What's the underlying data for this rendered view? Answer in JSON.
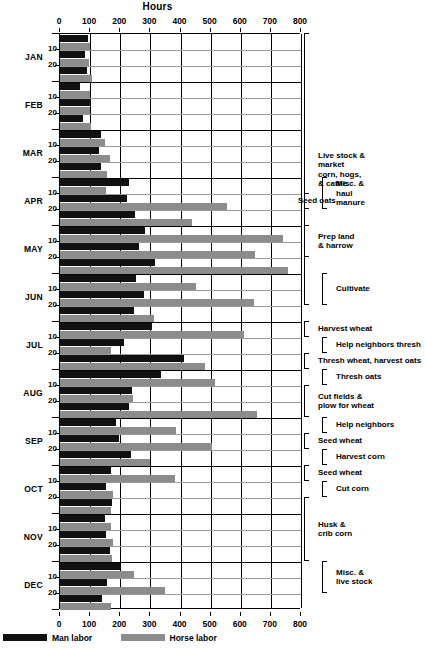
{
  "chart_data": {
    "type": "bar",
    "orientation": "horizontal",
    "title": "Hours",
    "xlabel": "Hours",
    "ylabel": "",
    "xlim": [
      0,
      800
    ],
    "xticks": [
      0,
      100,
      200,
      300,
      400,
      500,
      600,
      700,
      800
    ],
    "grid": true,
    "legend_position": "bottom-left",
    "legend": [
      "Man labor",
      "Horse labor"
    ],
    "series": [
      {
        "name": "Man labor",
        "color": "#111111"
      },
      {
        "name": "Horse labor",
        "color": "#8c8c8c"
      }
    ],
    "months": [
      "JAN",
      "FEB",
      "MAR",
      "APR",
      "MAY",
      "JUN",
      "JUL",
      "AUG",
      "SEP",
      "OCT",
      "NOV",
      "DEC"
    ],
    "period_ticks": [
      "10",
      "20"
    ],
    "rows": [
      {
        "month": "JAN",
        "period": "1",
        "man": 92,
        "horse": 98
      },
      {
        "month": "JAN",
        "period": "10",
        "man": 83,
        "horse": 96
      },
      {
        "month": "JAN",
        "period": "20",
        "man": 88,
        "horse": 105
      },
      {
        "month": "FEB",
        "period": "1",
        "man": 68,
        "horse": 98
      },
      {
        "month": "FEB",
        "period": "10",
        "man": 104,
        "horse": 101
      },
      {
        "month": "FEB",
        "period": "20",
        "man": 78,
        "horse": 102
      },
      {
        "month": "MAR",
        "period": "1",
        "man": 136,
        "horse": 148
      },
      {
        "month": "MAR",
        "period": "10",
        "man": 128,
        "horse": 167
      },
      {
        "month": "MAR",
        "period": "20",
        "man": 135,
        "horse": 157
      },
      {
        "month": "APR",
        "period": "1",
        "man": 229,
        "horse": 152
      },
      {
        "month": "APR",
        "period": "10",
        "man": 222,
        "horse": 555
      },
      {
        "month": "APR",
        "period": "20",
        "man": 250,
        "horse": 438
      },
      {
        "month": "MAY",
        "period": "1",
        "man": 283,
        "horse": 740
      },
      {
        "month": "MAY",
        "period": "10",
        "man": 261,
        "horse": 648
      },
      {
        "month": "MAY",
        "period": "20",
        "man": 315,
        "horse": 758
      },
      {
        "month": "JUN",
        "period": "1",
        "man": 251,
        "horse": 450
      },
      {
        "month": "JUN",
        "period": "10",
        "man": 278,
        "horse": 644
      },
      {
        "month": "JUN",
        "period": "20",
        "man": 246,
        "horse": 312
      },
      {
        "month": "JUL",
        "period": "1",
        "man": 305,
        "horse": 610
      },
      {
        "month": "JUL",
        "period": "10",
        "man": 214,
        "horse": 168
      },
      {
        "month": "JUL",
        "period": "20",
        "man": 412,
        "horse": 480
      },
      {
        "month": "AUG",
        "period": "1",
        "man": 336,
        "horse": 515
      },
      {
        "month": "AUG",
        "period": "10",
        "man": 238,
        "horse": 243
      },
      {
        "month": "AUG",
        "period": "20",
        "man": 228,
        "horse": 655
      },
      {
        "month": "SEP",
        "period": "1",
        "man": 186,
        "horse": 384
      },
      {
        "month": "SEP",
        "period": "10",
        "man": 196,
        "horse": 503
      },
      {
        "month": "SEP",
        "period": "20",
        "man": 235,
        "horse": 300
      },
      {
        "month": "OCT",
        "period": "1",
        "man": 168,
        "horse": 383
      },
      {
        "month": "OCT",
        "period": "10",
        "man": 152,
        "horse": 176
      },
      {
        "month": "OCT",
        "period": "20",
        "man": 172,
        "horse": 170
      },
      {
        "month": "NOV",
        "period": "1",
        "man": 148,
        "horse": 170
      },
      {
        "month": "NOV",
        "period": "10",
        "man": 152,
        "horse": 177
      },
      {
        "month": "NOV",
        "period": "20",
        "man": 167,
        "horse": 174
      },
      {
        "month": "DEC",
        "period": "1",
        "man": 198,
        "horse": 247
      },
      {
        "month": "DEC",
        "period": "10",
        "man": 155,
        "horse": 350
      },
      {
        "month": "DEC",
        "period": "20",
        "man": 140,
        "horse": 168
      }
    ],
    "annotations": [
      {
        "label": "Live stock &\nmarket\ncorn, hogs,\n& cattle",
        "from_row": 0,
        "to_row": 17
      },
      {
        "label": "Misc. &\nhaul\nmanure",
        "from_row": 9,
        "to_row": 11
      },
      {
        "label": "Seed oats",
        "from_row": 10,
        "to_row": 11
      },
      {
        "label": "Prep land\n& harrow",
        "from_row": 12,
        "to_row": 14
      },
      {
        "label": "Cultivate",
        "from_row": 15,
        "to_row": 17
      },
      {
        "label": "Harvest wheat",
        "from_row": 18,
        "to_row": 19
      },
      {
        "label": "Help neighbors thresh",
        "from_row": 19,
        "to_row": 20
      },
      {
        "label": "Thresh wheat, harvest oats",
        "from_row": 20,
        "to_row": 21
      },
      {
        "label": "Thresh oats",
        "from_row": 21,
        "to_row": 22
      },
      {
        "label": "Cut fields &\nplow for wheat",
        "from_row": 22,
        "to_row": 24
      },
      {
        "label": "Help neighbors",
        "from_row": 24,
        "to_row": 25
      },
      {
        "label": "Seed wheat",
        "from_row": 25,
        "to_row": 26
      },
      {
        "label": "Harvest corn",
        "from_row": 26,
        "to_row": 27
      },
      {
        "label": "Seed wheat",
        "from_row": 27,
        "to_row": 28
      },
      {
        "label": "Cut corn",
        "from_row": 28,
        "to_row": 29
      },
      {
        "label": "Husk &\ncrib corn",
        "from_row": 29,
        "to_row": 33
      },
      {
        "label": "Misc. &\nlive stock",
        "from_row": 33,
        "to_row": 35
      }
    ]
  },
  "axis": {
    "title": "Hours",
    "tick_labels": [
      "0",
      "100",
      "200",
      "300",
      "400",
      "500",
      "600",
      "700",
      "800"
    ]
  },
  "legend": {
    "items": [
      {
        "name": "man-labor",
        "label": "Man labor",
        "color": "#111111"
      },
      {
        "name": "horse-labor",
        "label": "Horse labor",
        "color": "#8c8c8c"
      }
    ]
  },
  "left_axis": {
    "months": [
      "JAN",
      "FEB",
      "MAR",
      "APR",
      "MAY",
      "JUN",
      "JUL",
      "AUG",
      "SEP",
      "OCT",
      "NOV",
      "DEC"
    ],
    "period_labels": [
      "10",
      "20"
    ]
  }
}
